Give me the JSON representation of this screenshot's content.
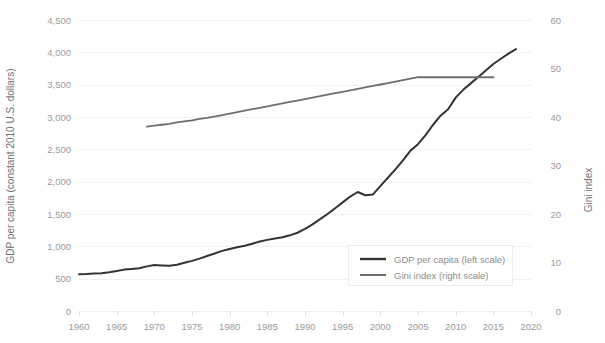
{
  "chart_data": {
    "type": "line",
    "title": "",
    "subtitle": "",
    "xlabel": "",
    "ylabel": "GDP per capita (constant 2010 U.S. dollars)",
    "y2label": "Gini index",
    "xlim": [
      1960,
      2020
    ],
    "ylim": [
      0,
      4500
    ],
    "y2lim": [
      0,
      60
    ],
    "grid": true,
    "legend_position": "bottom-right",
    "x_ticks": [
      1960,
      1965,
      1970,
      1975,
      1980,
      1985,
      1990,
      1995,
      2000,
      2005,
      2010,
      2015,
      2020
    ],
    "x_tick_labels": [
      "1960",
      "1965",
      "1970",
      "1975",
      "1980",
      "1985",
      "1990",
      "1995",
      "2000",
      "2005",
      "2010",
      "2015",
      "2020"
    ],
    "y_ticks": [
      0,
      500,
      1000,
      1500,
      2000,
      2500,
      3000,
      3500,
      4000,
      4500
    ],
    "y_tick_labels": [
      "0",
      "500",
      "1,000",
      "1,500",
      "2,000",
      "2,500",
      "3,000",
      "3,500",
      "4,000",
      "4,500"
    ],
    "y2_ticks": [
      0,
      10,
      20,
      30,
      40,
      50,
      60
    ],
    "y2_tick_labels": [
      "0",
      "10",
      "20",
      "30",
      "40",
      "50",
      "60"
    ],
    "series": [
      {
        "name": "GDP per capita (left scale)",
        "axis": "left",
        "color": "#333333",
        "line_width": 2.0,
        "x": [
          1960,
          1961,
          1962,
          1963,
          1964,
          1965,
          1966,
          1967,
          1968,
          1969,
          1970,
          1971,
          1972,
          1973,
          1974,
          1975,
          1976,
          1977,
          1978,
          1979,
          1980,
          1981,
          1982,
          1983,
          1984,
          1985,
          1986,
          1987,
          1988,
          1989,
          1990,
          1991,
          1992,
          1993,
          1994,
          1995,
          1996,
          1997,
          1998,
          1999,
          2000,
          2001,
          2002,
          2003,
          2004,
          2005,
          2006,
          2007,
          2008,
          2009,
          2010,
          2011,
          2012,
          2013,
          2014,
          2015,
          2016,
          2017,
          2018
        ],
        "y": [
          570,
          572,
          578,
          585,
          600,
          618,
          640,
          650,
          660,
          690,
          710,
          705,
          700,
          715,
          745,
          775,
          810,
          850,
          890,
          930,
          960,
          985,
          1010,
          1040,
          1075,
          1100,
          1120,
          1140,
          1170,
          1210,
          1270,
          1340,
          1420,
          1500,
          1590,
          1680,
          1770,
          1840,
          1790,
          1800,
          1930,
          2060,
          2190,
          2330,
          2480,
          2580,
          2720,
          2880,
          3020,
          3120,
          3300,
          3420,
          3520,
          3620,
          3720,
          3820,
          3900,
          3980,
          4050
        ]
      },
      {
        "name": "Gini index (right scale)",
        "axis": "right",
        "color": "#6e6e6e",
        "line_width": 1.8,
        "x": [
          1969,
          1970,
          1971,
          1972,
          1973,
          1974,
          1975,
          1976,
          1977,
          1978,
          1979,
          1980,
          1981,
          1982,
          1983,
          1984,
          1985,
          1986,
          1987,
          1988,
          1989,
          1990,
          1991,
          1992,
          1993,
          1994,
          1995,
          1996,
          1997,
          1998,
          1999,
          2000,
          2001,
          2002,
          2003,
          2004,
          2005,
          2006,
          2007,
          2008,
          2009,
          2010,
          2011,
          2012,
          2013,
          2014,
          2015
        ],
        "y": [
          38.0,
          38.2,
          38.4,
          38.6,
          38.9,
          39.1,
          39.3,
          39.6,
          39.8,
          40.1,
          40.4,
          40.7,
          41.0,
          41.3,
          41.6,
          41.9,
          42.2,
          42.5,
          42.8,
          43.1,
          43.4,
          43.7,
          44.0,
          44.3,
          44.6,
          44.9,
          45.2,
          45.5,
          45.8,
          46.1,
          46.4,
          46.7,
          47.0,
          47.3,
          47.6,
          47.9,
          48.2,
          48.2,
          48.2,
          48.2,
          48.2,
          48.2,
          48.2,
          48.2,
          48.2,
          48.2,
          48.2
        ]
      }
    ],
    "legend": [
      {
        "label": "GDP per capita (left scale)",
        "color": "#333333"
      },
      {
        "label": "Gini index (right scale)",
        "color": "#6e6e6e"
      }
    ]
  }
}
